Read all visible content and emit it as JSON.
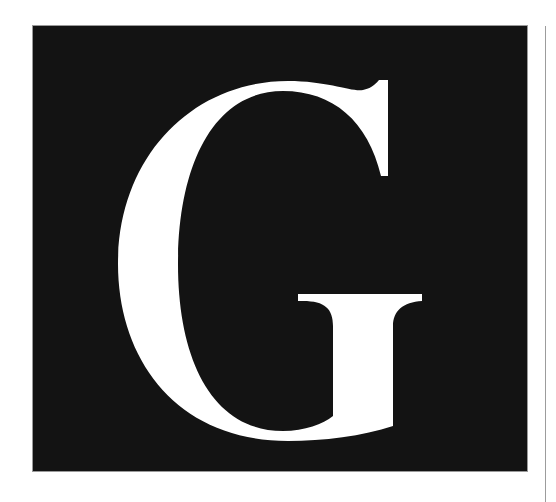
{
  "logo": {
    "letter": "G",
    "background_color": "#131313",
    "letter_color": "#ffffff",
    "border_color": "#9a9a9a"
  },
  "divider": {
    "color": "#9c9c9c"
  }
}
